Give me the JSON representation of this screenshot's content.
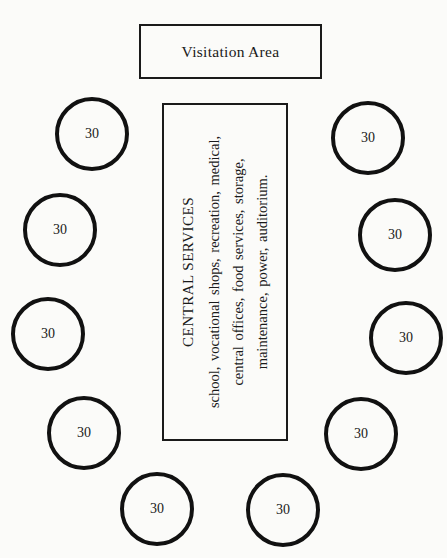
{
  "visitation_area": {
    "label": "Visitation Area"
  },
  "central_services": {
    "title": "CENTRAL SERVICES",
    "lines": [
      "school, vocational shops, recreation, medical,",
      "central offices, food services, storage,",
      "maintenance, power, auditorium."
    ]
  },
  "housing_units": [
    {
      "id": 1,
      "capacity": "30",
      "side": "left"
    },
    {
      "id": 2,
      "capacity": "30",
      "side": "left"
    },
    {
      "id": 3,
      "capacity": "30",
      "side": "left"
    },
    {
      "id": 4,
      "capacity": "30",
      "side": "left"
    },
    {
      "id": 5,
      "capacity": "30",
      "side": "bottom-left"
    },
    {
      "id": 6,
      "capacity": "30",
      "side": "bottom-right"
    },
    {
      "id": 7,
      "capacity": "30",
      "side": "right"
    },
    {
      "id": 8,
      "capacity": "30",
      "side": "right"
    },
    {
      "id": 9,
      "capacity": "30",
      "side": "right"
    },
    {
      "id": 10,
      "capacity": "30",
      "side": "right"
    }
  ],
  "colors": {
    "stroke": "#111111",
    "background": "#fbfbf9"
  }
}
